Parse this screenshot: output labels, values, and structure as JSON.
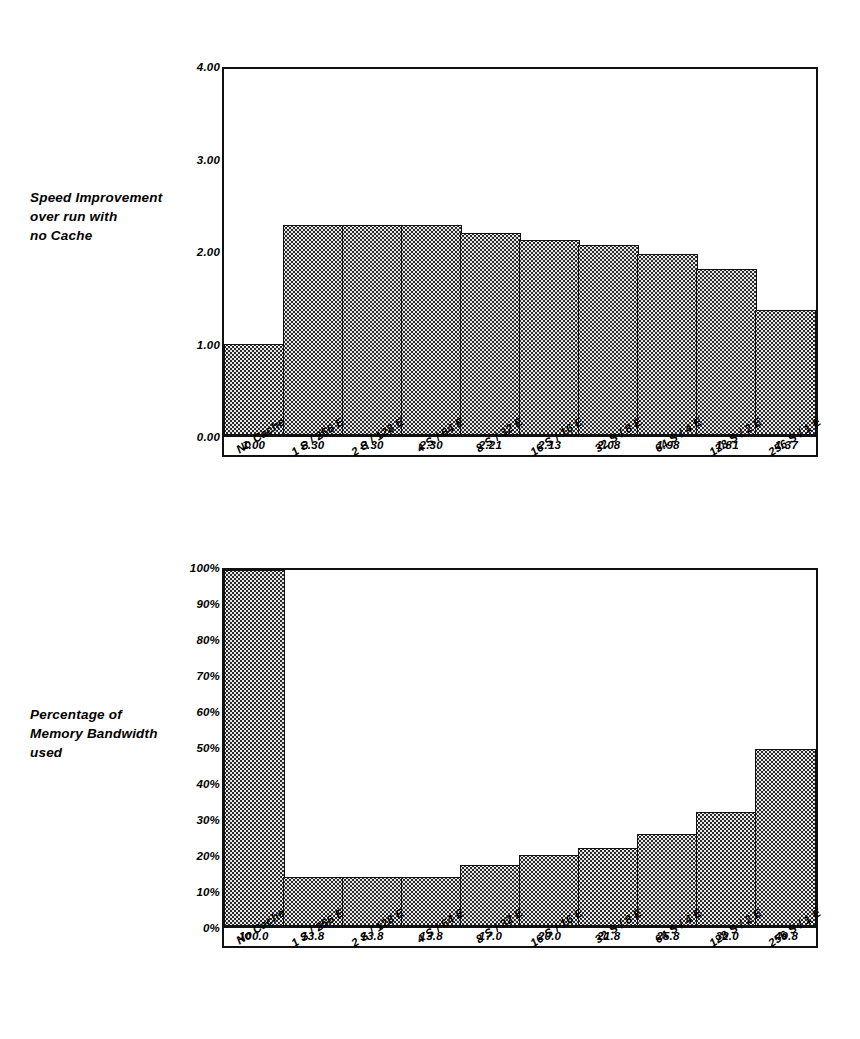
{
  "figure": {
    "background_color": "#ffffff",
    "ink_color": "#111111",
    "bar_light_fill": "#e8e8e8",
    "bar_dark_fill": "#2b2b2b"
  },
  "charts": [
    {
      "id": "speed-improvement",
      "caption": "Speed Improvement\nover run with\nno Cache",
      "chart_data": {
        "type": "bar",
        "title": "Speed Improvement over run with no Cache",
        "xlabel": "",
        "ylabel": "Speed Improvement over run with no Cache",
        "ylim": [
          0,
          4
        ],
        "yticks": [
          "0.00",
          "1.00",
          "2.00",
          "3.00",
          "4.00"
        ],
        "ytick_values": [
          0,
          1,
          2,
          3,
          4
        ],
        "grid": false,
        "legend": "none",
        "categories": [
          "No Cache",
          "1 S / 256 E",
          "2 S / 128 E",
          "4 S / 64 E",
          "8 S / 32 E",
          "16 S / 16 E",
          "32 S / 8 E",
          "64 S / 4 E",
          "128 S / 2 E",
          "256 S / 1 E"
        ],
        "values": [
          1.0,
          2.3,
          2.3,
          2.3,
          2.21,
          2.13,
          2.08,
          1.98,
          1.81,
          1.37
        ],
        "data_labels": [
          "1.00",
          "2.30",
          "2.30",
          "2.30",
          "2.21",
          "2.13",
          "2.08",
          "1.98",
          "1.81",
          "1.37"
        ],
        "bar_styles": [
          "dark",
          "light",
          "light",
          "light",
          "light",
          "light",
          "light",
          "light",
          "light",
          "light"
        ]
      }
    },
    {
      "id": "memory-bandwidth",
      "caption": "Percentage of\nMemory Bandwidth\nused",
      "chart_data": {
        "type": "bar",
        "title": "Percentage of Memory Bandwidth used",
        "xlabel": "",
        "ylabel": "Percentage of Memory Bandwidth used",
        "ylim": [
          0,
          100
        ],
        "yticks": [
          "0%",
          "10%",
          "20%",
          "30%",
          "40%",
          "50%",
          "60%",
          "70%",
          "80%",
          "90%",
          "100%"
        ],
        "ytick_values": [
          0,
          10,
          20,
          30,
          40,
          50,
          60,
          70,
          80,
          90,
          100
        ],
        "grid": false,
        "legend": "none",
        "categories": [
          "No Cache",
          "1 S / 256 E",
          "2 S / 128 E",
          "4 S / 64 E",
          "8 S / 32 E",
          "16 S / 16 E",
          "32 S / 8 E",
          "64 S / 4 E",
          "128 S / 2 E",
          "256 S / 1 E"
        ],
        "values": [
          100.0,
          13.8,
          13.8,
          13.8,
          17.0,
          20.0,
          21.8,
          25.8,
          32.0,
          49.8
        ],
        "data_labels": [
          "100.0",
          "13.8",
          "13.8",
          "13.8",
          "17.0",
          "20.0",
          "21.8",
          "25.8",
          "32.0",
          "49.8"
        ],
        "bar_styles": [
          "dark",
          "light",
          "light",
          "light",
          "light",
          "light",
          "light",
          "light",
          "light",
          "light"
        ]
      }
    }
  ]
}
